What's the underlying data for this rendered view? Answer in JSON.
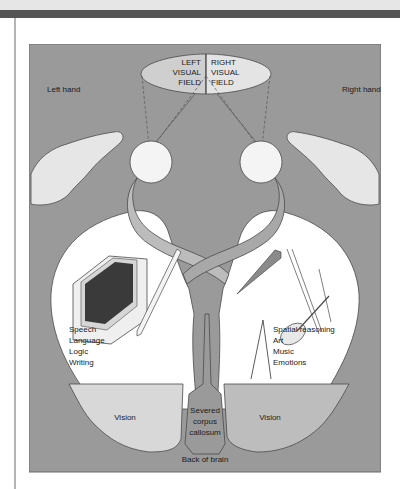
{
  "figure": {
    "visual_fields": {
      "left": [
        "LEFT",
        "VISUAL",
        "FIELD"
      ],
      "right": [
        "RIGHT",
        "VISUAL",
        "FIELD"
      ]
    },
    "hands": {
      "left": "Left hand",
      "right": "Right hand"
    },
    "left_hemisphere": {
      "functions": [
        "Speech",
        "Language",
        "Logic",
        "Writing"
      ],
      "vision": "Vision"
    },
    "right_hemisphere": {
      "functions": [
        "Spatial reasoning",
        "Art",
        "Music",
        "Emotions"
      ],
      "vision": "Vision"
    },
    "corpus_callosum": [
      "Severed",
      "corpus",
      "callosum"
    ],
    "back_of_brain": "Back of brain",
    "colors": {
      "background": "#9a9a9a",
      "frontal_region": "#ffffff",
      "left_vision": "#d8d8d8",
      "right_vision": "#bdbdbd",
      "optic_pathway": "#bcbcbc",
      "outline": "#4a4a4a"
    }
  }
}
